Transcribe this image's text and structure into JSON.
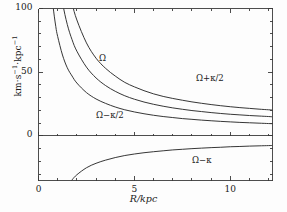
{
  "figure": {
    "background": "#fdfdfd",
    "line_color": "#2b2b2b",
    "axis_color": "#3a3a3a"
  },
  "axis_labels": {
    "x": "R/kpc",
    "y_main": "km·s",
    "y_exp1": "−1",
    "y_mid": "·kpc",
    "y_exp2": "−1"
  },
  "ticks": {
    "x_major_labels": [
      "0",
      "5",
      "10"
    ],
    "x_major_values": [
      0,
      5,
      10
    ],
    "x_minor_values": [
      1,
      2,
      3,
      4,
      6,
      7,
      8,
      9,
      11,
      12
    ],
    "y_major_labels": [
      "0",
      "50",
      "100"
    ],
    "y_major_values": [
      0,
      50,
      100
    ],
    "y_minor_values": [
      10,
      20,
      30,
      40,
      60,
      70,
      80,
      90
    ]
  },
  "curve_labels": [
    {
      "name": "omega-plus-half-kappa",
      "text": "Ω+κ/2",
      "x": 196,
      "y": 73
    },
    {
      "name": "omega",
      "text": "Ω",
      "x": 99,
      "y": 53
    },
    {
      "name": "omega-minus-half-kappa",
      "text": "Ω−κ/2",
      "x": 96,
      "y": 110
    },
    {
      "name": "omega-minus-kappa",
      "text": "Ω−κ",
      "x": 192,
      "y": 155
    }
  ],
  "chart_data": {
    "type": "line",
    "title": "",
    "xlabel": "R/kpc",
    "ylabel": "km·s⁻¹·kpc⁻¹",
    "xlim": [
      0,
      12.2
    ],
    "ylim": [
      -35,
      100
    ],
    "grid": false,
    "legend": "inline-curve-labels",
    "zero_line": true,
    "x": [
      0.25,
      0.4,
      0.5,
      0.6,
      0.75,
      0.9,
      1.0,
      1.25,
      1.5,
      1.75,
      2.0,
      2.5,
      3.0,
      3.5,
      4.0,
      4.5,
      5.0,
      5.5,
      6.0,
      6.5,
      7.0,
      7.5,
      8.0,
      8.5,
      9.0,
      9.5,
      10.0,
      10.5,
      11.0,
      11.5,
      12.0,
      12.2
    ],
    "series": [
      {
        "name": "Ω+κ/2",
        "values": [
          760,
          470,
          375,
          312,
          248,
          205,
          184,
          146,
          121,
          104,
          91,
          73,
          61,
          53,
          47,
          42,
          38.5,
          35.5,
          33,
          31,
          29.4,
          28,
          26.7,
          25.6,
          24.6,
          23.7,
          22.9,
          22.2,
          21.6,
          21.0,
          20.5,
          20.3
        ]
      },
      {
        "name": "Ω",
        "values": [
          530,
          330,
          263,
          220,
          176,
          146,
          131,
          105,
          87.5,
          75.5,
          66.5,
          54,
          45.5,
          39.5,
          35,
          31.5,
          28.8,
          26.6,
          24.8,
          23.3,
          22.0,
          20.9,
          19.9,
          19.1,
          18.3,
          17.6,
          17.0,
          16.5,
          16.0,
          15.6,
          15.2,
          15.0
        ]
      },
      {
        "name": "Ω−κ/2",
        "values": [
          300,
          190,
          152,
          128,
          103,
          86,
          78,
          63.5,
          53.5,
          47,
          41.5,
          34,
          29,
          25.5,
          22.7,
          20.5,
          18.8,
          17.4,
          16.2,
          15.2,
          14.4,
          13.6,
          13.0,
          12.4,
          11.9,
          11.4,
          11.0,
          10.6,
          10.3,
          10.0,
          9.7,
          9.6
        ]
      },
      {
        "name": "Ω−κ",
        "values": [
          -230,
          -145,
          -115,
          -96,
          -77,
          -64,
          -58,
          -47,
          -39.5,
          -34.5,
          -30.5,
          -25,
          -21.5,
          -19,
          -17,
          -15.4,
          -14.2,
          -13.2,
          -12.4,
          -11.7,
          -11.0,
          -10.5,
          -10.0,
          -9.6,
          -9.2,
          -8.9,
          -8.5,
          -8.3,
          -8.0,
          -7.8,
          -7.6,
          -7.5
        ]
      }
    ],
    "notes": {
      "omega_minus_kappa_enters_frame_at_R": 6.3,
      "values_at_right_edge": {
        "Ω+κ/2": 20.3,
        "Ω": 15.0,
        "Ω−κ/2": 9.6,
        "Ω−κ": -7.5
      }
    }
  }
}
